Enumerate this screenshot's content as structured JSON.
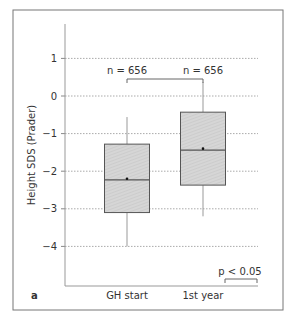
{
  "panel_label": "a",
  "chart_data": {
    "type": "box",
    "title": "",
    "xlabel": "",
    "ylabel": "Height SDS (Prader)",
    "ylim": [
      -4.9,
      1.9
    ],
    "yticks": [
      1,
      0,
      -1,
      -2,
      -3,
      -4
    ],
    "ytick_labels": [
      "1",
      "0",
      "−1",
      "−2",
      "−3",
      "−4"
    ],
    "grid": "horizontal-dotted",
    "categories": [
      "GH start",
      "1st year"
    ],
    "boxes": [
      {
        "label": "GH start",
        "n_label": "n = 656",
        "whisker_low": -4.0,
        "q1": -3.1,
        "median": -2.23,
        "mean": -2.2,
        "q3": -1.28,
        "whisker_high": -0.56
      },
      {
        "label": "1st year",
        "n_label": "n = 656",
        "whisker_low": -3.2,
        "q1": -2.37,
        "median": -1.44,
        "mean": -1.4,
        "q3": -0.43,
        "whisker_high": 0.37
      }
    ],
    "annotations": [
      {
        "text": "n = 656",
        "position": "above GH start"
      },
      {
        "text": "n = 656",
        "position": "above 1st year"
      },
      {
        "text": "p < 0.05",
        "position": "bottom-right legend bracket"
      }
    ],
    "significance_label": "p < 0.05",
    "colors": {
      "box_fill": "#d4d4d4",
      "box_edge": "#555555",
      "grid": "#aaaaaa",
      "axis": "#888888"
    }
  }
}
